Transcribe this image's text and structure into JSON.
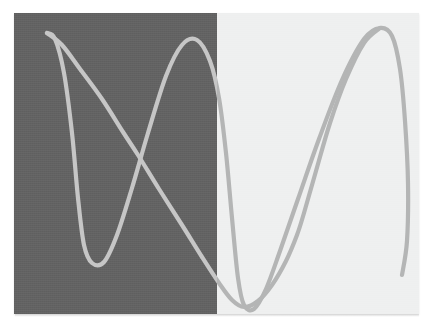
{
  "figure": {
    "canvas": {
      "width": 432,
      "height": 335,
      "page_background": "#ffffff"
    },
    "plot_area": {
      "x": 14,
      "y": 13,
      "width": 405,
      "height": 301
    },
    "panels": [
      {
        "name": "left-dark-panel",
        "fill": "#636363",
        "x": 0,
        "width": 203,
        "label": ""
      },
      {
        "name": "right-light-panel",
        "fill": "#eff0f0",
        "x": 203,
        "width": 202,
        "label": ""
      }
    ],
    "divider_x": 203,
    "curve_style": {
      "stroke_on_dark": "#c6c6c6",
      "stroke_on_light": "#b4b5b5",
      "stroke_width": 4.2,
      "linecap": "round",
      "linejoin": "round",
      "fill": "none"
    }
  },
  "chart_data": {
    "type": "line",
    "subtitle": "",
    "xlabel": "",
    "ylabel": "",
    "grid": false,
    "legend": false,
    "axes_visible": false,
    "tick_labels_x": [],
    "tick_labels_y": [],
    "xlim": [
      0,
      405
    ],
    "ylim": [
      0,
      301
    ],
    "background_split": {
      "left_fill": "#636363",
      "right_fill": "#eff0f0",
      "split_at_x": 203
    },
    "series": [
      {
        "name": "wave-a",
        "description": "High-frequency sine: starts at upper-left peak, dips to a low trough, rises to a mid peak, plunges to a second low trough past the divider, rises to a right peak, then drops to the lower-right.",
        "stroke": "#c6c6c6",
        "points": [
          [
            33,
            20
          ],
          [
            41,
            26
          ],
          [
            50,
            60
          ],
          [
            58,
            120
          ],
          [
            64,
            185
          ],
          [
            70,
            232
          ],
          [
            78,
            250
          ],
          [
            90,
            249
          ],
          [
            103,
            222
          ],
          [
            118,
            175
          ],
          [
            134,
            120
          ],
          [
            152,
            63
          ],
          [
            168,
            32
          ],
          [
            183,
            27
          ],
          [
            196,
            48
          ],
          [
            205,
            85
          ],
          [
            212,
            140
          ],
          [
            218,
            205
          ],
          [
            224,
            265
          ],
          [
            230,
            292
          ],
          [
            240,
            296
          ],
          [
            252,
            276
          ],
          [
            266,
            238
          ],
          [
            284,
            186
          ],
          [
            305,
            126
          ],
          [
            328,
            67
          ],
          [
            350,
            26
          ],
          [
            366,
            15
          ],
          [
            378,
            23
          ],
          [
            386,
            56
          ],
          [
            391,
            108
          ],
          [
            394,
            170
          ],
          [
            393,
            228
          ],
          [
            388,
            262
          ]
        ]
      },
      {
        "name": "wave-b",
        "description": "Low-frequency descending sweep: long diagonal from the upper-left peak down through both panel crossings to the lower-right trough and back up.",
        "stroke": "#c6c6c6",
        "points": [
          [
            33,
            20
          ],
          [
            48,
            32
          ],
          [
            66,
            56
          ],
          [
            88,
            86
          ],
          [
            109,
            119
          ],
          [
            124,
            142
          ],
          [
            145,
            176
          ],
          [
            168,
            212
          ],
          [
            188,
            244
          ],
          [
            205,
            270
          ],
          [
            218,
            287
          ],
          [
            230,
            294
          ],
          [
            244,
            288
          ],
          [
            258,
            272
          ],
          [
            272,
            248
          ],
          [
            283,
            222
          ],
          [
            290,
            200
          ],
          [
            302,
            158
          ],
          [
            316,
            110
          ],
          [
            332,
            66
          ],
          [
            350,
            30
          ],
          [
            366,
            15
          ]
        ]
      }
    ],
    "crossings": [
      {
        "name": "left-panel-crossing",
        "x": 109,
        "y": 142
      },
      {
        "name": "right-panel-crossing",
        "x": 276,
        "y": 147
      }
    ],
    "extrema": [
      {
        "name": "upper-left-peak",
        "x": 33,
        "y": 20,
        "kind": "max"
      },
      {
        "name": "left-trough",
        "x": 84,
        "y": 250,
        "kind": "min"
      },
      {
        "name": "mid-peak",
        "x": 183,
        "y": 27,
        "kind": "max"
      },
      {
        "name": "center-trough",
        "x": 234,
        "y": 295,
        "kind": "min"
      },
      {
        "name": "right-peak",
        "x": 368,
        "y": 15,
        "kind": "max"
      },
      {
        "name": "lower-right-trough",
        "x": 391,
        "y": 250,
        "kind": "min"
      }
    ]
  }
}
